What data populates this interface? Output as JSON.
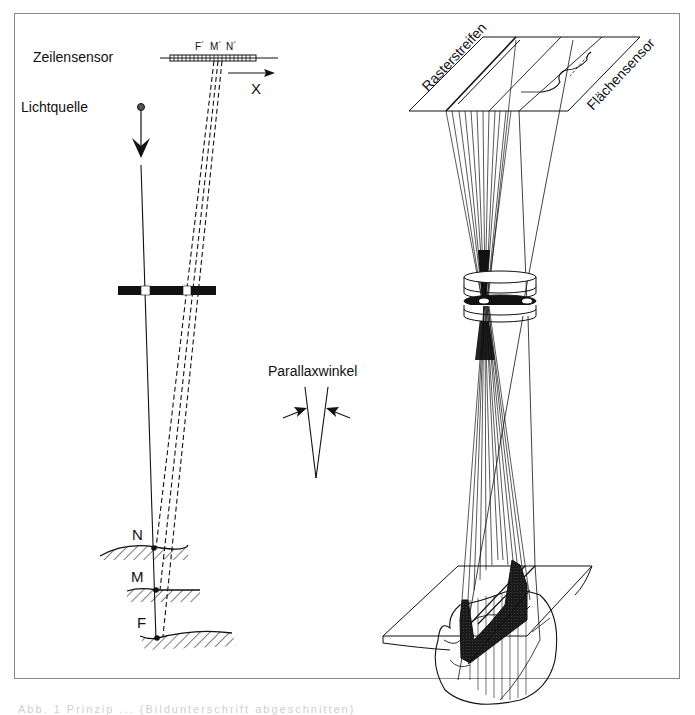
{
  "figure": {
    "left_diagram": {
      "labels": {
        "line_sensor": "Zeilensensor",
        "light_source": "Lichtquelle",
        "x_axis": "X",
        "sensor_points": [
          "F´",
          "M´",
          "N´"
        ],
        "surface_points": [
          "N",
          "M",
          "F"
        ]
      }
    },
    "middle": {
      "parallax_label": "Parallaxwinkel"
    },
    "right_diagram": {
      "labels": {
        "raster_stripes": "Rasterstreifen",
        "area_sensor": "Flächensensor"
      }
    },
    "colors": {
      "ink": "#111111",
      "frame": "#8a8a8a",
      "background": "#ffffff"
    }
  },
  "caption": {
    "text": "Abb. 1  Prinzip ...   (Bildunterschrift abgeschnitten)"
  }
}
